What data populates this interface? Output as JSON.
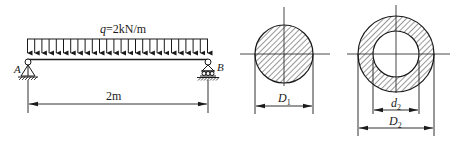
{
  "beam": {
    "load_label_var": "q",
    "load_label_value": "=2kN/m",
    "support_left": "A",
    "support_right": "B",
    "span_label": "2m",
    "load_arrow_count": 26
  },
  "section_solid": {
    "diameter_label": "D",
    "diameter_subscript": "1"
  },
  "section_hollow": {
    "inner_label": "d",
    "inner_subscript": "2",
    "outer_label": "D",
    "outer_subscript": "2"
  },
  "colors": {
    "ink": "#1a1a1a",
    "background": "#ffffff"
  }
}
